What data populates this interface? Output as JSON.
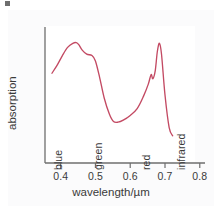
{
  "figure": {
    "name": "absorption-spectrum-figure",
    "background_color": "#ffffff",
    "axis_color": "#6e6e6e",
    "curve_color": "#c34a63",
    "text_color": "#3a3a3a"
  },
  "chart_data": {
    "type": "line",
    "title": "",
    "subtitle": "",
    "xlabel": "wavelength/µm",
    "ylabel": "absorption",
    "xlim": [
      0.355,
      0.815
    ],
    "ylim": [
      0,
      1
    ],
    "grid": false,
    "legend": null,
    "x_ticks": [
      "0.4",
      "0.5",
      "0.6",
      "0.7",
      "0.8"
    ],
    "x_tick_values": [
      0.4,
      0.5,
      0.6,
      0.7,
      0.8
    ],
    "y_ticks": [],
    "annotations": [
      {
        "label": "blue",
        "x": 0.42,
        "orientation": "vertical"
      },
      {
        "label": "green",
        "x": 0.535,
        "orientation": "vertical"
      },
      {
        "label": "red",
        "x": 0.675,
        "orientation": "vertical"
      },
      {
        "label": "infrared",
        "x": 0.775,
        "orientation": "vertical"
      }
    ],
    "series": [
      {
        "name": "absorption",
        "color": "#c34a63",
        "x": [
          0.375,
          0.39,
          0.405,
          0.42,
          0.435,
          0.445,
          0.452,
          0.462,
          0.475,
          0.49,
          0.5,
          0.512,
          0.525,
          0.54,
          0.552,
          0.565,
          0.58,
          0.6,
          0.62,
          0.638,
          0.652,
          0.66,
          0.665,
          0.672,
          0.678,
          0.684,
          0.69,
          0.7,
          0.712,
          0.722
        ],
        "y": [
          0.66,
          0.72,
          0.79,
          0.85,
          0.88,
          0.885,
          0.87,
          0.83,
          0.8,
          0.79,
          0.75,
          0.63,
          0.48,
          0.36,
          0.305,
          0.3,
          0.315,
          0.35,
          0.4,
          0.49,
          0.58,
          0.65,
          0.62,
          0.68,
          0.82,
          0.88,
          0.8,
          0.5,
          0.26,
          0.2
        ]
      }
    ]
  },
  "axes": {
    "x_axis_name": "x-axis",
    "y_axis_name": "y-axis"
  }
}
